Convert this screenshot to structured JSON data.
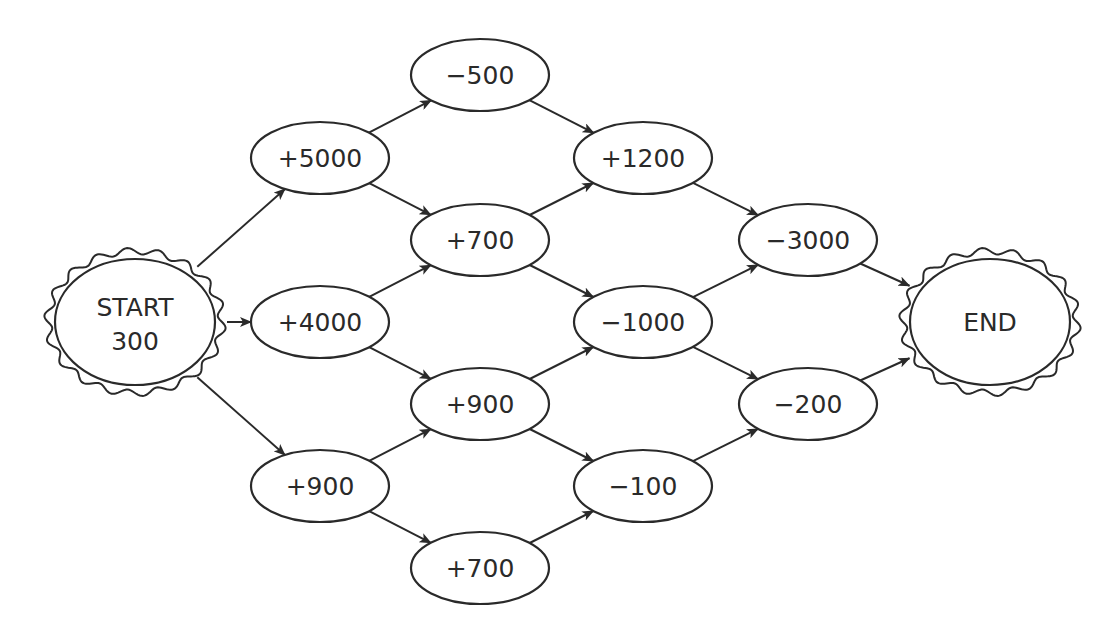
{
  "diagram": {
    "type": "flow-network",
    "colors": {
      "stroke": "#2a2a2a",
      "background": "#ffffff",
      "node_fill": "#ffffff"
    },
    "start": {
      "id": "start",
      "line1": "START",
      "line2": "300",
      "x": 135,
      "y": 322
    },
    "end": {
      "id": "end",
      "label": "END",
      "x": 990,
      "y": 322
    },
    "nodes": [
      {
        "id": "c1a",
        "label": "+5000",
        "x": 320,
        "y": 158
      },
      {
        "id": "c1b",
        "label": "+4000",
        "x": 320,
        "y": 322
      },
      {
        "id": "c1c",
        "label": "+900",
        "x": 320,
        "y": 486
      },
      {
        "id": "c2a",
        "label": "−500",
        "x": 480,
        "y": 75
      },
      {
        "id": "c2b",
        "label": "+700",
        "x": 480,
        "y": 240
      },
      {
        "id": "c2c",
        "label": "+900",
        "x": 480,
        "y": 404
      },
      {
        "id": "c2d",
        "label": "+700",
        "x": 480,
        "y": 568
      },
      {
        "id": "c3a",
        "label": "+1200",
        "x": 643,
        "y": 158
      },
      {
        "id": "c3b",
        "label": "−1000",
        "x": 643,
        "y": 322
      },
      {
        "id": "c3c",
        "label": "−100",
        "x": 643,
        "y": 486
      },
      {
        "id": "c4a",
        "label": "−3000",
        "x": 808,
        "y": 240
      },
      {
        "id": "c4b",
        "label": "−200",
        "x": 808,
        "y": 404
      }
    ],
    "edges": [
      [
        "start",
        "c1a"
      ],
      [
        "start",
        "c1b"
      ],
      [
        "start",
        "c1c"
      ],
      [
        "c1a",
        "c2a"
      ],
      [
        "c1a",
        "c2b"
      ],
      [
        "c1b",
        "c2b"
      ],
      [
        "c1b",
        "c2c"
      ],
      [
        "c1c",
        "c2c"
      ],
      [
        "c1c",
        "c2d"
      ],
      [
        "c2a",
        "c3a"
      ],
      [
        "c2b",
        "c3a"
      ],
      [
        "c2b",
        "c3b"
      ],
      [
        "c2c",
        "c3b"
      ],
      [
        "c2c",
        "c3c"
      ],
      [
        "c2d",
        "c3c"
      ],
      [
        "c3a",
        "c4a"
      ],
      [
        "c3b",
        "c4a"
      ],
      [
        "c3b",
        "c4b"
      ],
      [
        "c3c",
        "c4b"
      ],
      [
        "c4a",
        "end"
      ],
      [
        "c4b",
        "end"
      ]
    ]
  }
}
